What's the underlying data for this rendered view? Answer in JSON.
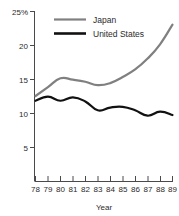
{
  "chart_data": {
    "type": "line",
    "title": "",
    "xlabel": "Year",
    "ylabel": "",
    "grid": false,
    "legend_position": "top-center",
    "x": [
      "78",
      "79",
      "80",
      "81",
      "82",
      "83",
      "84",
      "85",
      "86",
      "87",
      "88",
      "89"
    ],
    "xlim": [
      78,
      89
    ],
    "ylim": [
      0,
      25
    ],
    "yticks": [
      5,
      10,
      15,
      20,
      25
    ],
    "ytick_labels": [
      "5",
      "10",
      "15",
      "20",
      "25%"
    ],
    "series": [
      {
        "name": "Japan",
        "color": "#808080",
        "values": [
          12.5,
          13.8,
          15.1,
          14.9,
          14.6,
          14.1,
          14.4,
          15.3,
          16.4,
          18.0,
          20.1,
          23.0
        ]
      },
      {
        "name": "United States",
        "color": "#111111",
        "values": [
          11.8,
          12.4,
          11.8,
          12.3,
          11.7,
          10.4,
          10.8,
          10.9,
          10.4,
          9.6,
          10.2,
          9.7
        ]
      }
    ]
  },
  "axes": {
    "y_tick_labels": [
      "25%",
      "20",
      "15",
      "10",
      "5"
    ],
    "x_tick_labels": [
      "78",
      "79",
      "80",
      "81",
      "82",
      "83",
      "84",
      "85",
      "86",
      "87",
      "88",
      "89"
    ],
    "x_axis_title": "Year"
  },
  "legend": {
    "items": [
      {
        "label": "Japan",
        "color": "#808080"
      },
      {
        "label": "United States",
        "color": "#111111"
      }
    ]
  }
}
